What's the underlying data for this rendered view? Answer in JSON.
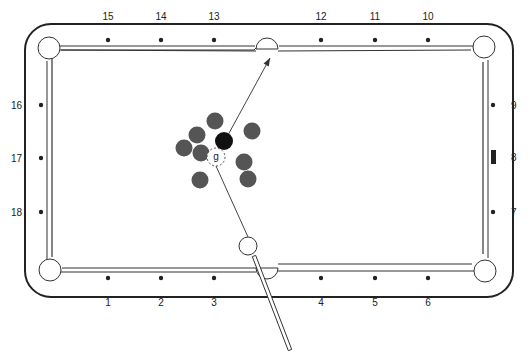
{
  "diagram": {
    "colors": {
      "rail": "#222222",
      "ball": "#555555",
      "target_ball": "#111111",
      "cue_ball": "#ffffff",
      "diamond": "#222222"
    },
    "diamonds": {
      "top": [
        {
          "label": "15",
          "x": 108
        },
        {
          "label": "14",
          "x": 161
        },
        {
          "label": "13",
          "x": 214
        },
        {
          "label": "12",
          "x": 321
        },
        {
          "label": "11",
          "x": 375
        },
        {
          "label": "10",
          "x": 428
        }
      ],
      "bottom": [
        {
          "label": "1",
          "x": 108
        },
        {
          "label": "2",
          "x": 161
        },
        {
          "label": "3",
          "x": 214
        },
        {
          "label": "4",
          "x": 321
        },
        {
          "label": "5",
          "x": 375
        },
        {
          "label": "6",
          "x": 428
        }
      ],
      "left": [
        {
          "label": "16",
          "y": 105
        },
        {
          "label": "17",
          "y": 158
        },
        {
          "label": "18",
          "y": 212
        }
      ],
      "right": [
        {
          "label": "9",
          "y": 105
        },
        {
          "label": "8",
          "y": 157,
          "marker": "bar"
        },
        {
          "label": "7",
          "y": 212
        }
      ]
    },
    "balls": [
      {
        "x": 215,
        "y": 121
      },
      {
        "x": 252,
        "y": 131
      },
      {
        "x": 197,
        "y": 135
      },
      {
        "x": 184,
        "y": 148
      },
      {
        "x": 201,
        "y": 153
      },
      {
        "x": 244,
        "y": 162
      },
      {
        "x": 248,
        "y": 179
      },
      {
        "x": 200,
        "y": 180
      }
    ],
    "object_ball": {
      "x": 224,
      "y": 141
    },
    "ghost_ball": {
      "x": 216,
      "y": 157,
      "label": "g"
    },
    "cue_ball": {
      "x": 248,
      "y": 246
    },
    "aim_arrow": {
      "from": [
        216,
        157
      ],
      "to": [
        270,
        58
      ]
    },
    "cue_line": {
      "from": [
        248,
        246
      ],
      "to": [
        216,
        157
      ]
    },
    "cue_stick": {
      "from": [
        254,
        256
      ],
      "to": [
        290,
        350
      ]
    }
  }
}
